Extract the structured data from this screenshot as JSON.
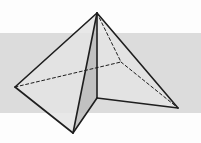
{
  "diagram": {
    "type": "solid-geometry",
    "colors": {
      "background": "#fdfdfd",
      "band": "#dcdcdc",
      "face_light": "#e4e4e4",
      "face_mid": "#d2d2d2",
      "face_dark": "#bcbcbc",
      "edge": "#1e1e1e"
    },
    "band": {
      "y_top": 33,
      "y_bottom": 113
    },
    "vertices": {
      "apex": [
        97,
        13
      ],
      "left": [
        15,
        87
      ],
      "bottom": [
        73,
        133
      ],
      "right": [
        178,
        108
      ],
      "back": [
        121,
        62
      ],
      "fold": [
        97,
        98
      ]
    },
    "solid_edges": [
      [
        "apex",
        "left"
      ],
      [
        "left",
        "bottom"
      ],
      [
        "apex",
        "bottom"
      ],
      [
        "apex",
        "fold"
      ],
      [
        "fold",
        "bottom"
      ],
      [
        "fold",
        "right"
      ],
      [
        "apex",
        "right"
      ]
    ],
    "dashed_edges": [
      [
        "left",
        "back"
      ],
      [
        "back",
        "right"
      ],
      [
        "apex",
        "back"
      ]
    ]
  }
}
